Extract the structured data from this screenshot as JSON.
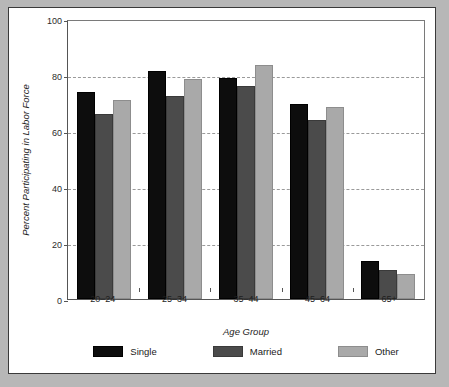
{
  "chart_data": {
    "type": "bar",
    "title": "",
    "xlabel": "Age Group",
    "ylabel": "Percent Participating in Labor Force",
    "categories": [
      "20–24",
      "25–34",
      "35–44",
      "45–64",
      "65+"
    ],
    "series": [
      {
        "name": "Single",
        "color": "#0d0d0d",
        "values": [
          74,
          81.5,
          79,
          69.5,
          13.5
        ]
      },
      {
        "name": "Married",
        "color": "#4b4b4b",
        "values": [
          66,
          72.5,
          76,
          64,
          10.5
        ]
      },
      {
        "name": "Other",
        "color": "#a9a9a9",
        "values": [
          71,
          78.5,
          83.5,
          68.5,
          9
        ]
      }
    ],
    "ylim": [
      0,
      100
    ],
    "yticks": [
      0,
      20,
      40,
      60,
      80,
      100
    ],
    "ytick_labels": [
      "0",
      "20",
      "40",
      "60",
      "80",
      "100"
    ],
    "grid": true,
    "grid_style": "dashed-horizontal",
    "legend_position": "bottom"
  },
  "figure": {
    "background_color": "#b7b7b7",
    "panel_color": "#ffffff",
    "frame_color": "#3a3a3a"
  }
}
